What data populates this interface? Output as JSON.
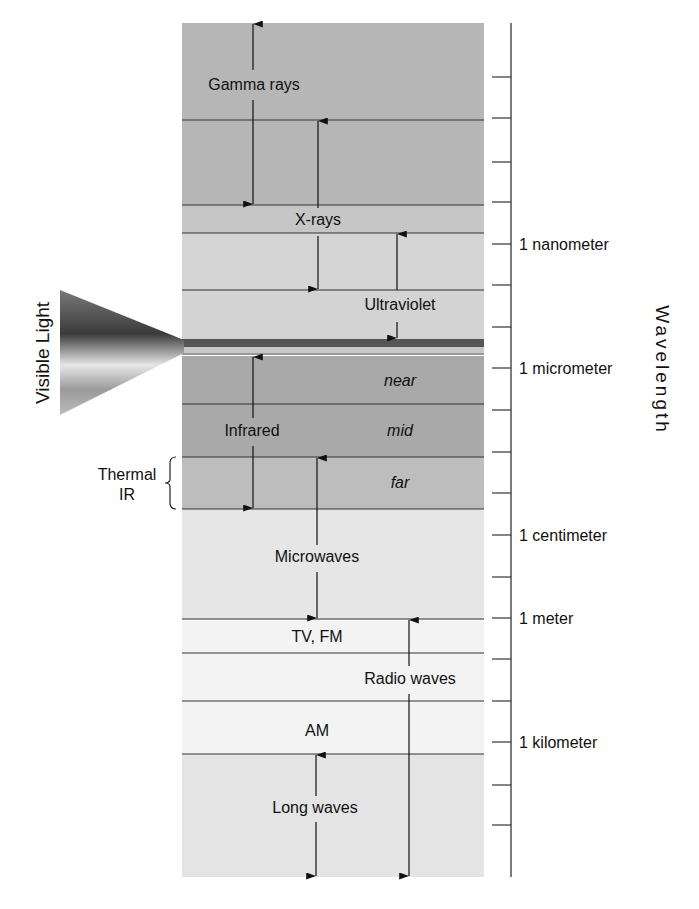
{
  "diagram": {
    "title_side": "Visible Light",
    "axis_title": "Wavelength",
    "frame": {
      "x": 182,
      "right": 484,
      "top": 23,
      "bottom": 877
    },
    "bands": [
      {
        "name": "gamma-xray-upper",
        "top": 23,
        "bottom": 205,
        "color": "#b6b6b6"
      },
      {
        "name": "xray-label",
        "top": 205,
        "bottom": 233,
        "color": "#c6c6c6"
      },
      {
        "name": "uv-upper",
        "top": 233,
        "bottom": 290,
        "color": "#d5d5d5"
      },
      {
        "name": "uv-lower",
        "top": 290,
        "bottom": 339,
        "color": "#d3d3d3"
      },
      {
        "name": "ir-near",
        "top": 356,
        "bottom": 404,
        "color": "#a9a9a9"
      },
      {
        "name": "ir-mid",
        "top": 404,
        "bottom": 457,
        "color": "#a9a9a9"
      },
      {
        "name": "ir-far",
        "top": 457,
        "bottom": 509,
        "color": "#bdbdbd"
      },
      {
        "name": "microwaves",
        "top": 509,
        "bottom": 619,
        "color": "#e6e6e6"
      },
      {
        "name": "tv-fm",
        "top": 619,
        "bottom": 653,
        "color": "#f3f3f3"
      },
      {
        "name": "radio-mid",
        "top": 653,
        "bottom": 701,
        "color": "#f3f3f3"
      },
      {
        "name": "am",
        "top": 701,
        "bottom": 754,
        "color": "#f3f3f3"
      },
      {
        "name": "long-waves",
        "top": 754,
        "bottom": 877,
        "color": "#e4e4e4"
      }
    ],
    "divider_lines": [
      120,
      205,
      233,
      290,
      354,
      404,
      457,
      509,
      619,
      653,
      701,
      754
    ],
    "visible_stripe": {
      "dark_top": 339,
      "dark_bottom": 347,
      "light_top": 347,
      "light_bottom": 353,
      "dark_color": "#555555",
      "light_color": "#c8c8c8"
    },
    "labels": [
      {
        "id": "gamma",
        "text": "Gamma rays",
        "x": 254,
        "y": 90,
        "italic": false
      },
      {
        "id": "xrays",
        "text": "X-rays",
        "x": 318,
        "y": 225,
        "italic": false
      },
      {
        "id": "uv",
        "text": "Ultraviolet",
        "x": 400,
        "y": 310,
        "italic": false
      },
      {
        "id": "near",
        "text": "near",
        "x": 400,
        "y": 386,
        "italic": true
      },
      {
        "id": "infrared",
        "text": "Infrared",
        "x": 252,
        "y": 436,
        "italic": false
      },
      {
        "id": "mid",
        "text": "mid",
        "x": 400,
        "y": 436,
        "italic": true
      },
      {
        "id": "far",
        "text": "far",
        "x": 400,
        "y": 488,
        "italic": true
      },
      {
        "id": "microwaves",
        "text": "Microwaves",
        "x": 317,
        "y": 562,
        "italic": false
      },
      {
        "id": "tvfm",
        "text": "TV, FM",
        "x": 317,
        "y": 642,
        "italic": false
      },
      {
        "id": "radio",
        "text": "Radio waves",
        "x": 410,
        "y": 684,
        "italic": false
      },
      {
        "id": "am",
        "text": "AM",
        "x": 317,
        "y": 736,
        "italic": false
      },
      {
        "id": "longwaves",
        "text": "Long waves",
        "x": 315,
        "y": 813,
        "italic": false
      }
    ],
    "arrows": [
      {
        "id": "gamma-arrow",
        "x": 253,
        "y1": 23,
        "y2": 205,
        "gaps": [
          [
            70,
            100
          ]
        ]
      },
      {
        "id": "xray-arrow",
        "x": 318,
        "y1": 120,
        "y2": 290,
        "gaps": [
          [
            208,
            236
          ]
        ]
      },
      {
        "id": "uv-arrow",
        "x": 397,
        "y1": 233,
        "y2": 339,
        "gaps": [
          [
            290,
            322
          ]
        ]
      },
      {
        "id": "ir-arrow",
        "x": 253,
        "y1": 356,
        "y2": 509,
        "gaps": [
          [
            418,
            446
          ]
        ]
      },
      {
        "id": "microwave-arrow",
        "x": 317,
        "y1": 457,
        "y2": 619,
        "gaps": [
          [
            545,
            572
          ]
        ]
      },
      {
        "id": "radio-arrow",
        "x": 409,
        "y1": 619,
        "y2": 877,
        "gaps": [
          [
            666,
            694
          ]
        ]
      },
      {
        "id": "longwave-arrow",
        "x": 316,
        "y1": 754,
        "y2": 877,
        "gaps": [
          [
            796,
            822
          ]
        ]
      }
    ],
    "thermal_ir": {
      "line1": "Thermal",
      "line2": "IR",
      "x": 127,
      "y1": 480,
      "y2": 500,
      "brace_top": 457,
      "brace_bottom": 509,
      "brace_x": 170
    },
    "cone": {
      "base_x": 60,
      "base_top": 290,
      "base_bottom": 415,
      "apex_x": 184,
      "apex_top": 340,
      "apex_bottom": 353
    },
    "axis": {
      "x": 511,
      "top": 23,
      "bottom": 877,
      "ticks": [
        77,
        118,
        162,
        202,
        244,
        285,
        327,
        368,
        410,
        452,
        493,
        535,
        577,
        618,
        659,
        701,
        742,
        785,
        825
      ],
      "tick_labels": [
        {
          "y": 244,
          "text": "1 nanometer"
        },
        {
          "y": 368,
          "text": "1 micrometer"
        },
        {
          "y": 535,
          "text": "1 centimeter"
        },
        {
          "y": 618,
          "text": "1 meter"
        },
        {
          "y": 742,
          "text": "1 kilometer"
        }
      ]
    }
  }
}
